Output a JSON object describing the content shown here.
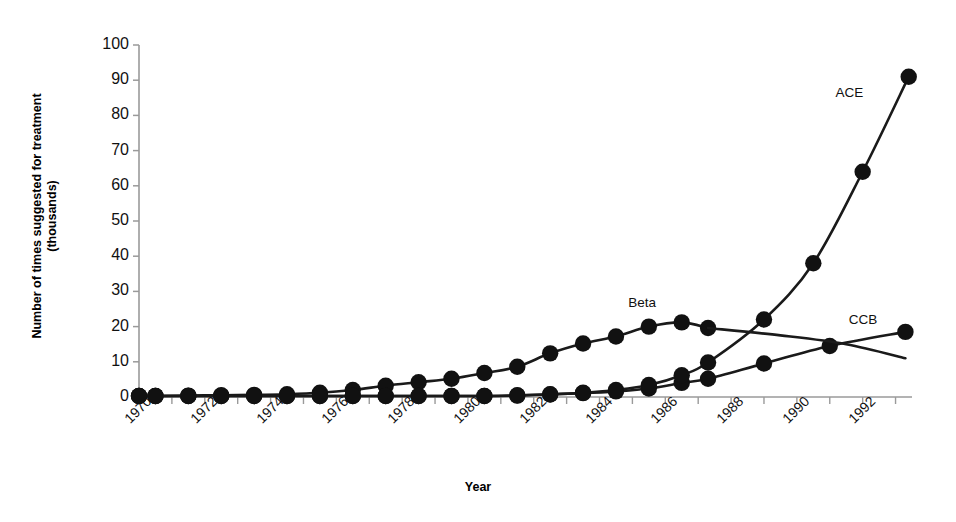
{
  "chart_data": {
    "type": "line",
    "title": "",
    "xlabel": "Year",
    "ylabel_line1": "Number of times suggested for treatment",
    "ylabel_line2": "(thousands)",
    "xlim": [
      1970,
      1993.5
    ],
    "ylim": [
      0,
      100
    ],
    "yticks": [
      0,
      10,
      20,
      30,
      40,
      50,
      60,
      70,
      80,
      90,
      100
    ],
    "xticks": [
      1970,
      1971,
      1972,
      1973,
      1974,
      1975,
      1976,
      1977,
      1978,
      1979,
      1980,
      1981,
      1982,
      1983,
      1984,
      1985,
      1986,
      1987,
      1988,
      1989,
      1990,
      1991,
      1992,
      1993
    ],
    "xtick_labels": [
      "1970",
      "1972",
      "1974",
      "1976",
      "1978",
      "1980",
      "1982",
      "1984",
      "1986",
      "1988",
      "1990",
      "1992"
    ],
    "xtick_label_years": [
      1970,
      1972,
      1974,
      1976,
      1978,
      1980,
      1982,
      1984,
      1986,
      1988,
      1990,
      1992
    ],
    "grid": false,
    "legend": "inline-annotations",
    "line_color": "#1a1a1a",
    "marker_color": "#111111",
    "series": [
      {
        "name": "Beta",
        "marker": "filled-circle",
        "label_x": 1985.3,
        "label_y": 26.5,
        "x": [
          1970,
          1970.5,
          1971.5,
          1972.5,
          1973.5,
          1974.5,
          1975.5,
          1976.5,
          1977.5,
          1978.5,
          1979.5,
          1980.5,
          1981.5,
          1982.5,
          1983.5,
          1984.5,
          1985.5,
          1986.5,
          1987.3
        ],
        "values": [
          0.3,
          0.3,
          0.4,
          0.5,
          0.6,
          0.8,
          1.2,
          2.0,
          3.2,
          4.2,
          5.2,
          6.8,
          8.6,
          12.4,
          15.2,
          17.2,
          20.0,
          21.2,
          19.6
        ]
      },
      {
        "name": "CCB",
        "marker": "filled-circle",
        "label_x": 1992.0,
        "label_y": 21.5,
        "x": [
          1970,
          1970.5,
          1971.5,
          1972.5,
          1973.5,
          1974.5,
          1975.5,
          1976.5,
          1977.5,
          1978.5,
          1979.5,
          1980.5,
          1981.5,
          1982.5,
          1983.5,
          1984.5,
          1985.5,
          1986.5,
          1987.3,
          1989,
          1991,
          1993.3
        ],
        "values": [
          0.3,
          0.3,
          0.3,
          0.3,
          0.3,
          0.3,
          0.3,
          0.3,
          0.3,
          0.3,
          0.3,
          0.3,
          0.5,
          0.8,
          1.1,
          1.6,
          2.4,
          4.0,
          5.2,
          9.5,
          14.5,
          18.5
        ]
      },
      {
        "name": "ACE",
        "marker": "filled-circle",
        "label_x": 1991.6,
        "label_y": 86.0,
        "x": [
          1970,
          1970.5,
          1971.5,
          1972.5,
          1973.5,
          1974.5,
          1975.5,
          1976.5,
          1977.5,
          1978.5,
          1979.5,
          1980.5,
          1981.5,
          1982.5,
          1983.5,
          1984.5,
          1985.5,
          1986.5,
          1987.3,
          1989,
          1990.5,
          1992,
          1993.4
        ],
        "values": [
          0.3,
          0.3,
          0.3,
          0.3,
          0.3,
          0.3,
          0.3,
          0.3,
          0.3,
          0.3,
          0.3,
          0.3,
          0.4,
          0.7,
          1.2,
          2.0,
          3.4,
          6.2,
          9.8,
          22.0,
          38.0,
          64.0,
          91.0
        ]
      },
      {
        "name": "Decline",
        "marker": "none",
        "label_x": null,
        "label_y": null,
        "x": [
          1987.3,
          1989.5,
          1991.5,
          1993.3
        ],
        "values": [
          19.6,
          17.5,
          15.0,
          11.0
        ]
      }
    ],
    "annotations": [
      {
        "text": "ACE",
        "x": 1991.6,
        "y": 86.0
      },
      {
        "text": "CCB",
        "x": 1992.0,
        "y": 21.5
      },
      {
        "text": "Beta",
        "x": 1985.3,
        "y": 26.5
      }
    ]
  }
}
